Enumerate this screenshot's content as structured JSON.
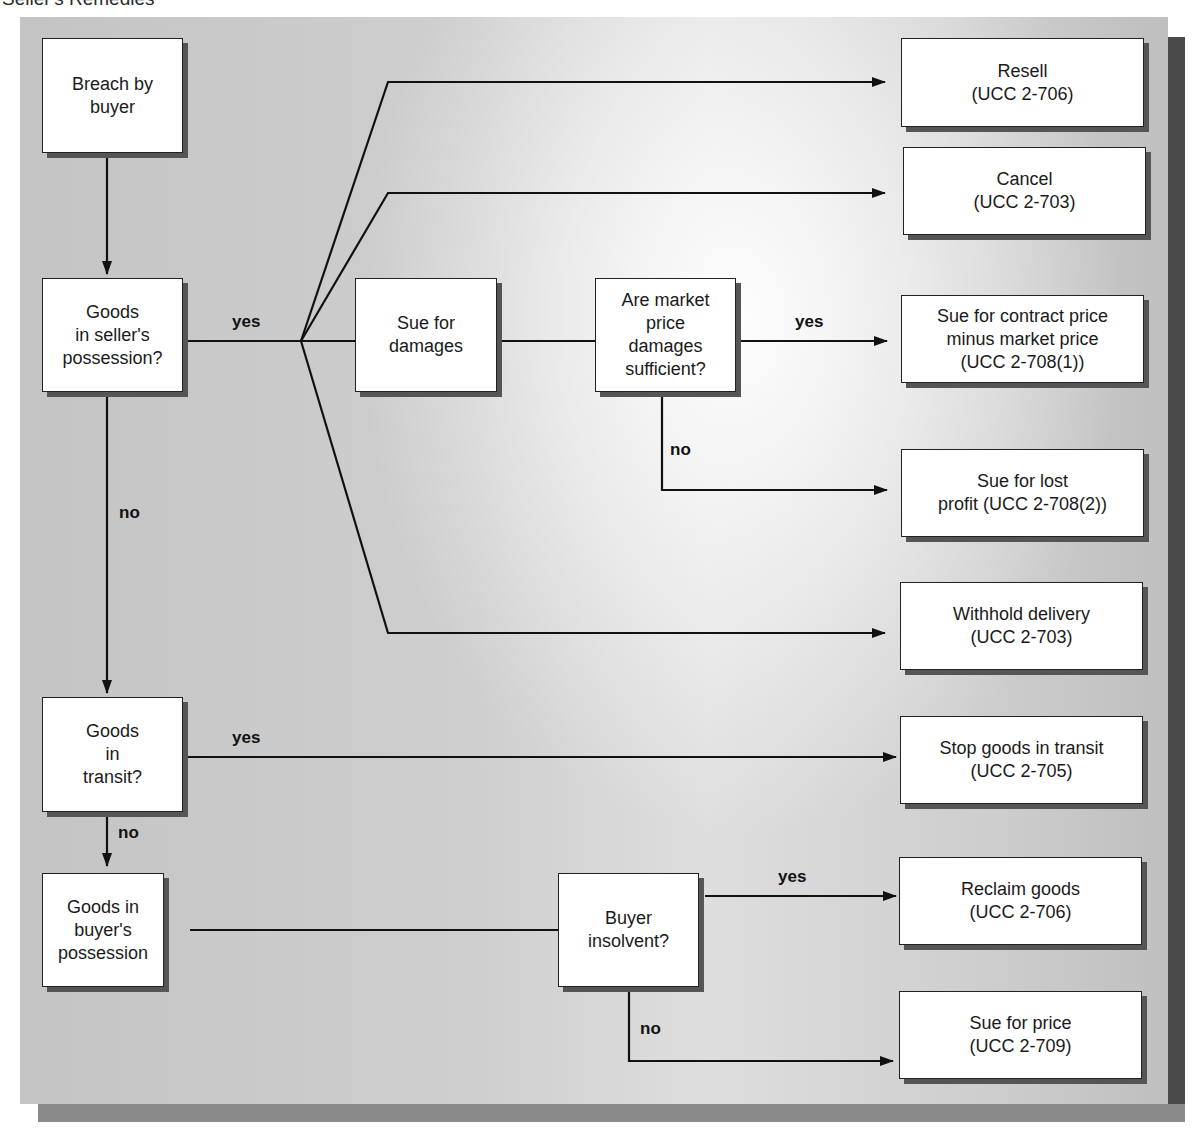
{
  "title": "Seller's Remedies",
  "nodes": {
    "breach": "Breach by\nbuyer",
    "seller_possession": "Goods\nin seller's\npossession?",
    "sue_damages": "Sue for\ndamages",
    "market_sufficient": "Are market\nprice\ndamages\nsufficient?",
    "in_transit": "Goods\nin\ntransit?",
    "buyer_possession": "Goods in\nbuyer's\npossession",
    "buyer_insolvent": "Buyer\ninsolvent?"
  },
  "remedies": {
    "resell": "Resell\n(UCC 2-706)",
    "cancel": "Cancel\n(UCC 2-703)",
    "contract_minus_market": "Sue for contract price\nminus market price\n(UCC 2-708(1))",
    "lost_profit": "Sue for lost\nprofit  (UCC 2-708(2))",
    "withhold": "Withhold delivery\n(UCC 2-703)",
    "stop_transit": "Stop goods in transit\n(UCC 2-705)",
    "reclaim": "Reclaim goods\n(UCC 2-706)",
    "sue_price": "Sue for price\n(UCC 2-709)"
  },
  "labels": {
    "seller_yes": "yes",
    "seller_no": "no",
    "market_yes": "yes",
    "market_no": "no",
    "transit_yes": "yes",
    "transit_no": "no",
    "insolvent_yes": "yes",
    "insolvent_no": "no"
  },
  "colors": {
    "line": "#111111",
    "box_fill": "#ffffff",
    "box_shadow": "#555555",
    "panel": "#c8c8c8"
  }
}
